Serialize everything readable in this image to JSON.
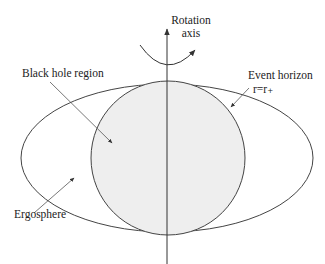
{
  "diagram": {
    "labels": {
      "rotation_axis_line1": "Rotation",
      "rotation_axis_line2": "axis",
      "black_hole_region": "Black hole region",
      "event_horizon": "Event horizon",
      "event_horizon_eq": "r=r₊",
      "ergosphere": "Ergosphere"
    },
    "colors": {
      "stroke": "#333333",
      "black_hole_fill": "#eeeeee",
      "background": "#ffffff"
    }
  }
}
